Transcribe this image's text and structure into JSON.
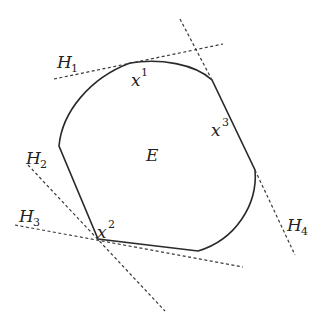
{
  "diagram": {
    "colors": {
      "stroke": "#2a2a2a",
      "dashed": "#3a3a3a",
      "text": "#222222",
      "background": "#ffffff"
    },
    "region_label": "E",
    "points": [
      {
        "name": "x",
        "sup": "1"
      },
      {
        "name": "x",
        "sup": "2"
      },
      {
        "name": "x",
        "sup": "3"
      }
    ],
    "hyperplanes": [
      {
        "name": "H",
        "sub": "1"
      },
      {
        "name": "H",
        "sub": "2"
      },
      {
        "name": "H",
        "sub": "3"
      },
      {
        "name": "H",
        "sub": "4"
      }
    ]
  }
}
